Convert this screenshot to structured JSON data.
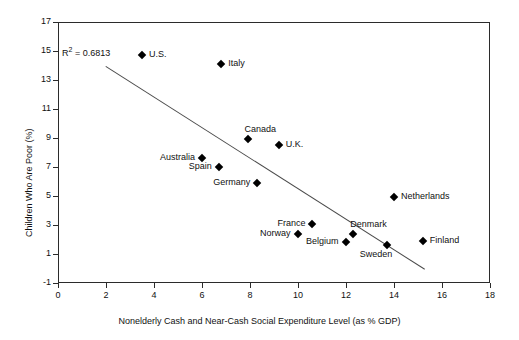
{
  "chart_data": {
    "type": "scatter",
    "title": "",
    "xlabel": "Nonelderly Cash and Near-Cash Social Expenditure Level (as % GDP)",
    "ylabel": "Children Who Are Poor (%)",
    "xlim": [
      0,
      18
    ],
    "ylim": [
      -1,
      17
    ],
    "xticks": [
      0,
      2,
      4,
      6,
      8,
      10,
      12,
      14,
      16,
      18
    ],
    "yticks": [
      -1,
      1,
      3,
      5,
      7,
      9,
      11,
      13,
      15,
      17
    ],
    "grid": false,
    "legend": "none",
    "annotations": [
      {
        "name": "r-squared",
        "text": "R² = 0.6813",
        "prefix": "R",
        "sup": "2",
        "rest": " = 0.6813"
      }
    ],
    "trendline": {
      "type": "linear",
      "x_start": 2.0,
      "y_start": 14.0,
      "x_end": 15.3,
      "y_end": 0.0
    },
    "points": [
      {
        "label": "U.S.",
        "x": 3.5,
        "y": 14.7,
        "label_pos": "right"
      },
      {
        "label": "Italy",
        "x": 6.8,
        "y": 14.1,
        "label_pos": "right"
      },
      {
        "label": "Canada",
        "x": 7.9,
        "y": 8.9,
        "label_pos": "above-right"
      },
      {
        "label": "U.K.",
        "x": 9.2,
        "y": 8.5,
        "label_pos": "right"
      },
      {
        "label": "Australia",
        "x": 6.0,
        "y": 7.6,
        "label_pos": "left"
      },
      {
        "label": "Spain",
        "x": 6.7,
        "y": 7.0,
        "label_pos": "left"
      },
      {
        "label": "Germany",
        "x": 8.3,
        "y": 5.9,
        "label_pos": "left"
      },
      {
        "label": "Netherlands",
        "x": 14.0,
        "y": 4.9,
        "label_pos": "right"
      },
      {
        "label": "France",
        "x": 10.6,
        "y": 3.1,
        "label_pos": "left"
      },
      {
        "label": "Norway",
        "x": 10.0,
        "y": 2.4,
        "label_pos": "left"
      },
      {
        "label": "Denmark",
        "x": 12.3,
        "y": 2.4,
        "label_pos": "above-right"
      },
      {
        "label": "Belgium",
        "x": 12.0,
        "y": 1.8,
        "label_pos": "left"
      },
      {
        "label": "Sweden",
        "x": 13.7,
        "y": 1.6,
        "label_pos": "below-left"
      },
      {
        "label": "Finland",
        "x": 15.2,
        "y": 1.9,
        "label_pos": "right"
      }
    ]
  }
}
